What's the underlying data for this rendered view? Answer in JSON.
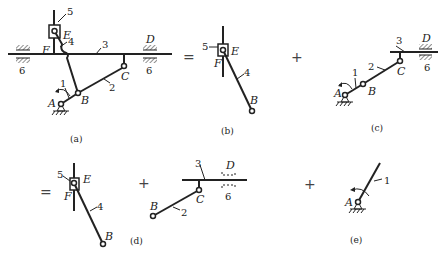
{
  "figure": {
    "colors": {
      "line": "#222222",
      "background": "#ffffff"
    },
    "operators": {
      "equals": "=",
      "plus": "+"
    },
    "panels": {
      "a": {
        "caption": "(a)",
        "points": {
          "A": "A",
          "B": "B",
          "C": "C",
          "D": "D",
          "E": "E",
          "F": "F"
        },
        "members": {
          "m1": "1",
          "m2": "2",
          "m3": "3",
          "m4": "4",
          "m5": "5",
          "m6_left": "6",
          "m6_right": "6"
        }
      },
      "b": {
        "caption": "(b)",
        "points": {
          "B": "B",
          "E": "E",
          "F": "F"
        },
        "members": {
          "m4": "4",
          "m5": "5"
        }
      },
      "c": {
        "caption": "(c)",
        "points": {
          "A": "A",
          "B": "B",
          "C": "C",
          "D": "D"
        },
        "members": {
          "m1": "1",
          "m2": "2",
          "m3": "3",
          "m6": "6"
        }
      },
      "d": {
        "caption": "(d)",
        "points": {
          "B": "B",
          "E": "E",
          "F": "F",
          "B2": "B",
          "C": "C",
          "D": "D"
        },
        "members": {
          "m4": "4",
          "m5": "5",
          "m2": "2",
          "m3": "3",
          "m6": "6"
        }
      },
      "e": {
        "caption": "(e)",
        "points": {
          "A": "A"
        },
        "members": {
          "m1": "1"
        }
      }
    }
  }
}
